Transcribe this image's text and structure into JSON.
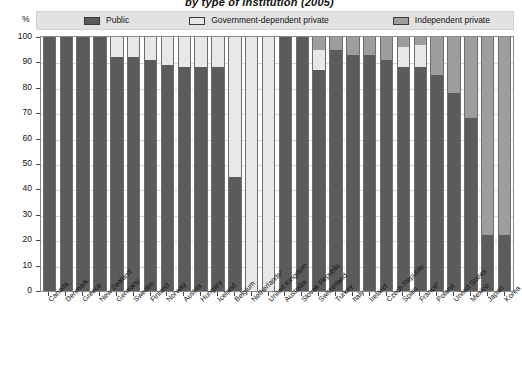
{
  "title": "by type of institution (2005)",
  "axis": {
    "unit_symbol": "%",
    "y_ticks": [
      100,
      90,
      80,
      70,
      60,
      50,
      40,
      30,
      20,
      10,
      0
    ]
  },
  "legend": {
    "items": [
      {
        "label": "Public",
        "color": "#5b5b5b",
        "key": "public"
      },
      {
        "label": "Government-dependent private",
        "color": "#e8e8e8",
        "key": "govdep"
      },
      {
        "label": "Independent private",
        "color": "#9d9d9d",
        "key": "indep"
      }
    ]
  },
  "chart_data": {
    "type": "bar",
    "subtype": "stacked-bar-100",
    "title": "by type of institution (2005)",
    "xlabel": "",
    "ylabel": "%",
    "ylim": [
      0,
      100
    ],
    "grid": true,
    "legend_position": "top",
    "categories": [
      "Canada",
      "Denmark",
      "Greece",
      "New Zealand",
      "Germany",
      "Sweden",
      "Finland",
      "Norway",
      "Austria",
      "Hungary",
      "Iceland",
      "Belgium",
      "Netherlands¹",
      "United Kingdom",
      "Australia",
      "Slovak Republic",
      "Switzerland",
      "Turkey",
      "Italy",
      "Ireland",
      "Czech Republic",
      "Spain",
      "France²",
      "Poland",
      "United States",
      "Mexico",
      "Japan",
      "Korea"
    ],
    "series": [
      {
        "name": "Public",
        "color": "#5b5b5b",
        "values": [
          100,
          100,
          100,
          100,
          92,
          92,
          91,
          89,
          88,
          88,
          88,
          45,
          0,
          0,
          100,
          100,
          87,
          95,
          93,
          93,
          91,
          88,
          88,
          85,
          78,
          68,
          22,
          22
        ]
      },
      {
        "name": "Government-dependent private",
        "color": "#e8e8e8",
        "values": [
          0,
          0,
          0,
          0,
          8,
          8,
          9,
          11,
          12,
          12,
          12,
          55,
          100,
          100,
          0,
          0,
          8,
          0,
          0,
          0,
          0,
          8,
          9,
          0,
          0,
          0,
          0,
          0
        ]
      },
      {
        "name": "Independent private",
        "color": "#9d9d9d",
        "values": [
          0,
          0,
          0,
          0,
          0,
          0,
          0,
          0,
          0,
          0,
          0,
          0,
          0,
          0,
          0,
          0,
          5,
          5,
          7,
          7,
          9,
          4,
          3,
          15,
          22,
          32,
          78,
          78
        ]
      }
    ]
  }
}
